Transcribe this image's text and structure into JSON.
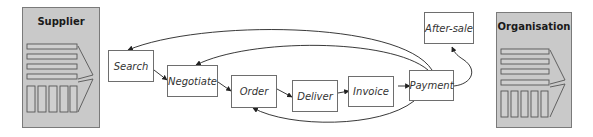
{
  "panels": {
    "supplier": {
      "title": "Supplier"
    },
    "organisation": {
      "title": "Organisation"
    }
  },
  "process": {
    "steps": [
      {
        "id": "search",
        "label": "Search"
      },
      {
        "id": "negotiate",
        "label": "Negotiate"
      },
      {
        "id": "order",
        "label": "Order"
      },
      {
        "id": "deliver",
        "label": "Deliver"
      },
      {
        "id": "invoice",
        "label": "Invoice"
      },
      {
        "id": "payment",
        "label": "Payment"
      },
      {
        "id": "after-sale",
        "label": "After-sale"
      }
    ],
    "flow": [
      {
        "from": "Search",
        "to": "Negotiate"
      },
      {
        "from": "Negotiate",
        "to": "Order"
      },
      {
        "from": "Order",
        "to": "Deliver"
      },
      {
        "from": "Deliver",
        "to": "Invoice"
      },
      {
        "from": "Invoice",
        "to": "Payment"
      },
      {
        "from": "Payment",
        "to": "After-sale"
      },
      {
        "from": "Payment",
        "to": "Search",
        "type": "feedback"
      },
      {
        "from": "Payment",
        "to": "Negotiate",
        "type": "feedback"
      },
      {
        "from": "Payment",
        "to": "Order",
        "type": "feedback"
      }
    ]
  },
  "colors": {
    "panel_fill": "#c9c9c9",
    "panel_border": "#7a7a7a",
    "box_border": "#6e6e6e",
    "arrow": "#222222"
  }
}
